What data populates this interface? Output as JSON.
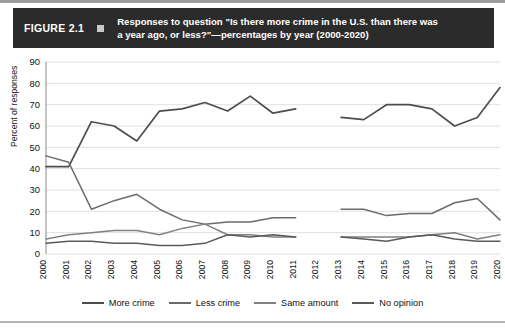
{
  "figure": {
    "number_label": "FIGURE 2.1",
    "title": "Responses to question \"Is there more crime in the U.S. than there was a year ago, or less?\"—percentages by year (2000-2020)",
    "title_line1": "Responses to question \"Is there more crime in the U.S. than there was",
    "title_line2": "a year ago, or less?\"—percentages by year (2000-2020)",
    "bar_color": "#2b2b2b",
    "bar_text_color": "#ffffff",
    "marker_color": "#c9c9c9"
  },
  "chart_data": {
    "type": "line",
    "title": "Responses to question \"Is there more crime in the U.S. than there was a year ago, or less?\"—percentages by year (2000-2020)",
    "xlabel": "",
    "ylabel": "Percent of responses",
    "ylim": [
      0,
      90
    ],
    "yticks": [
      0,
      10,
      20,
      30,
      40,
      50,
      60,
      70,
      80,
      90
    ],
    "grid": true,
    "legend_position": "bottom",
    "x": [
      2000,
      2001,
      2002,
      2003,
      2004,
      2005,
      2006,
      2007,
      2008,
      2009,
      2010,
      2011,
      2012,
      2013,
      2014,
      2015,
      2016,
      2017,
      2018,
      2019,
      2020
    ],
    "categories": [
      "2000",
      "2001",
      "2002",
      "2003",
      "2004",
      "2005",
      "2006",
      "2007",
      "2008",
      "2009",
      "2010",
      "2011",
      "2012",
      "2013",
      "2014",
      "2015",
      "2016",
      "2017",
      "2018",
      "2019",
      "2020"
    ],
    "missing_year": "2012",
    "series": [
      {
        "name": "More crime",
        "color": "#4d4d4d",
        "values": [
          41,
          41,
          62,
          60,
          53,
          67,
          68,
          71,
          67,
          74,
          66,
          68,
          null,
          64,
          63,
          70,
          70,
          68,
          60,
          64,
          78
        ]
      },
      {
        "name": "Less crime",
        "color": "#6b6b6b",
        "values": [
          46,
          43,
          21,
          25,
          28,
          21,
          16,
          14,
          15,
          15,
          17,
          17,
          null,
          21,
          21,
          18,
          19,
          19,
          24,
          26,
          16
        ]
      },
      {
        "name": "Same amount",
        "color": "#808080",
        "values": [
          7,
          9,
          10,
          11,
          11,
          9,
          12,
          14,
          9,
          9,
          8,
          8,
          null,
          8,
          8,
          8,
          8,
          9,
          10,
          7,
          9
        ]
      },
      {
        "name": "No opinion",
        "color": "#5a5a5a",
        "values": [
          5,
          6,
          6,
          5,
          5,
          4,
          4,
          5,
          9,
          8,
          9,
          8,
          null,
          8,
          7,
          6,
          8,
          9,
          7,
          6,
          6
        ]
      }
    ]
  }
}
